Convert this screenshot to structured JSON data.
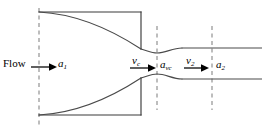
{
  "figure": {
    "background_color": "#ffffff",
    "wall_color": "#3a3a3a",
    "streamline_color": "#4a4a4a",
    "dashed_color": "#9a9a9a",
    "arrow_color": "#000000",
    "text_color": "#000000",
    "width": 262,
    "height": 135
  },
  "labels": {
    "flow": "Flow",
    "area_inlet": "a",
    "area_inlet_sub": "1",
    "velocity_contracta": "v",
    "velocity_contracta_sub": "c",
    "area_contracta": "a",
    "area_contracta_sub": "vc",
    "velocity_outlet": "v",
    "velocity_outlet_sub": "2",
    "area_outlet": "a",
    "area_outlet_sub": "2"
  },
  "sections": [
    {
      "name": "inlet-section",
      "x": 39,
      "label": "a1"
    },
    {
      "name": "vena-contracta-section",
      "x": 157,
      "label": "avc"
    },
    {
      "name": "outlet-section",
      "x": 212,
      "label": "a2"
    }
  ],
  "arrows": [
    {
      "name": "flow-arrow",
      "x1": 30,
      "x2": 52,
      "y": 67
    },
    {
      "name": "vc-arrow",
      "x1": 130,
      "x2": 155,
      "y": 68
    },
    {
      "name": "v2-arrow",
      "x1": 184,
      "x2": 208,
      "y": 68
    }
  ]
}
